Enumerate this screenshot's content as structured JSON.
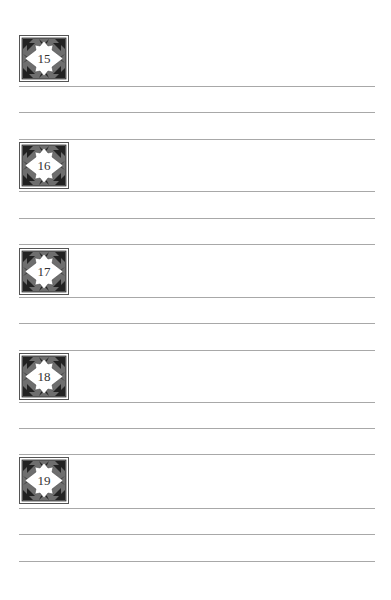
{
  "page": {
    "type": "lined-notes-page",
    "colors": {
      "rule": "#a8a8a8",
      "badge_field": "#6e6e6e",
      "badge_pattern": "#222222",
      "badge_center": "#ffffff",
      "badge_frame": "#555555"
    }
  },
  "sections": [
    {
      "number": "15",
      "icon": "diamond-ornament-badge-icon"
    },
    {
      "number": "16",
      "icon": "diamond-ornament-badge-icon"
    },
    {
      "number": "17",
      "icon": "diamond-ornament-badge-icon"
    },
    {
      "number": "18",
      "icon": "diamond-ornament-badge-icon"
    },
    {
      "number": "19",
      "icon": "diamond-ornament-badge-icon"
    }
  ]
}
